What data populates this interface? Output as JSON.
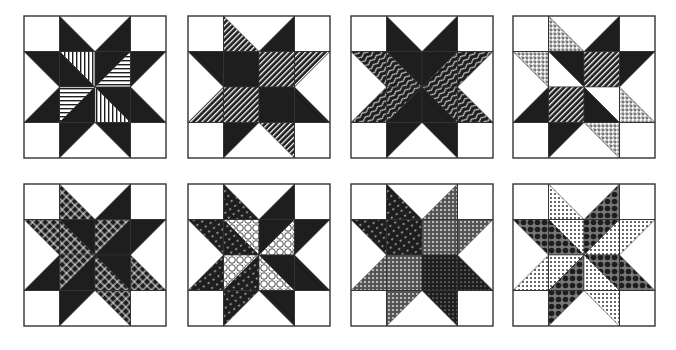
{
  "figure": {
    "grid": {
      "rows": 2,
      "cols": 4,
      "cells_per_block": 4
    },
    "colors": {
      "ink": "#1e1e1e",
      "paper": "#ffffff",
      "line": "#333333"
    },
    "blocks": [
      {
        "id": 1,
        "x": 23,
        "y": 15,
        "size": 142,
        "pieces": [
          [
            "n1L",
            "k"
          ],
          [
            "n1R",
            "k"
          ],
          [
            "e1U",
            "k"
          ],
          [
            "e1D",
            "k"
          ],
          [
            "s1L",
            "k"
          ],
          [
            "s1R",
            "k"
          ],
          [
            "w1U",
            "k"
          ],
          [
            "w1D",
            "k"
          ],
          [
            "cTLa",
            "vl"
          ],
          [
            "cTLb",
            "k"
          ],
          [
            "cTRa",
            "k"
          ],
          [
            "cTRb",
            "hl"
          ],
          [
            "cBLa",
            "hl"
          ],
          [
            "cBLb",
            "k"
          ],
          [
            "cBRa",
            "k"
          ],
          [
            "cBRb",
            "vl"
          ]
        ]
      },
      {
        "id": 2,
        "x": 187,
        "y": 15,
        "size": 142,
        "pieces": [
          [
            "n1L",
            "dg"
          ],
          [
            "n1R",
            "k"
          ],
          [
            "e1U",
            "dg"
          ],
          [
            "e1D",
            "k"
          ],
          [
            "s1L",
            "k"
          ],
          [
            "s1R",
            "dg"
          ],
          [
            "w1U",
            "k"
          ],
          [
            "w1D",
            "dg"
          ],
          [
            "cTL",
            "k"
          ],
          [
            "cTR",
            "dg"
          ],
          [
            "cBL",
            "dg"
          ],
          [
            "cBR",
            "k"
          ]
        ]
      },
      {
        "id": 3,
        "x": 350,
        "y": 15,
        "size": 142,
        "pieces": [
          [
            "n1L",
            "k"
          ],
          [
            "n1R",
            "k"
          ],
          [
            "e1U",
            "wv"
          ],
          [
            "e1D",
            "wv"
          ],
          [
            "s1L",
            "k"
          ],
          [
            "s1R",
            "k"
          ],
          [
            "w1U",
            "wv"
          ],
          [
            "w1D",
            "wv"
          ],
          [
            "xTL1",
            "k"
          ],
          [
            "xTL2",
            "wv"
          ],
          [
            "xTR1",
            "k"
          ],
          [
            "xTR2",
            "wv"
          ],
          [
            "xBL1",
            "wv"
          ],
          [
            "xBL2",
            "k"
          ],
          [
            "xBR1",
            "wv"
          ],
          [
            "xBR2",
            "k"
          ]
        ]
      },
      {
        "id": 4,
        "x": 512,
        "y": 15,
        "size": 142,
        "pieces": [
          [
            "n1L",
            "dt"
          ],
          [
            "n1R",
            "k"
          ],
          [
            "e1U",
            "k"
          ],
          [
            "e1D",
            "dt"
          ],
          [
            "s1L",
            "k"
          ],
          [
            "s1R",
            "dt"
          ],
          [
            "w1U",
            "dt"
          ],
          [
            "w1D",
            "k"
          ],
          [
            "cTLa",
            "k"
          ],
          [
            "cTLb",
            "w"
          ],
          [
            "cTR",
            "dg"
          ],
          [
            "cBL",
            "dg"
          ],
          [
            "cBRa",
            "w"
          ],
          [
            "cBRb",
            "k"
          ]
        ]
      },
      {
        "id": 5,
        "x": 23,
        "y": 183,
        "size": 142,
        "pieces": [
          [
            "n1L",
            "lt"
          ],
          [
            "n1R",
            "k"
          ],
          [
            "e1U",
            "k"
          ],
          [
            "e1D",
            "lt"
          ],
          [
            "s1L",
            "k"
          ],
          [
            "s1R",
            "lt"
          ],
          [
            "w1U",
            "lt"
          ],
          [
            "w1D",
            "k"
          ],
          [
            "cTLa",
            "k"
          ],
          [
            "cTLb",
            "lt"
          ],
          [
            "cTRa",
            "lt"
          ],
          [
            "cTRb",
            "k"
          ],
          [
            "cBLa",
            "lt"
          ],
          [
            "cBLb",
            "k"
          ],
          [
            "cBRa",
            "k"
          ],
          [
            "cBRb",
            "lt"
          ]
        ]
      },
      {
        "id": 6,
        "x": 187,
        "y": 183,
        "size": 142,
        "pieces": [
          [
            "n1L",
            "dd"
          ],
          [
            "n1R",
            "k"
          ],
          [
            "e1U",
            "k"
          ],
          [
            "e1D",
            "k"
          ],
          [
            "s1L",
            "dd"
          ],
          [
            "s1R",
            "k"
          ],
          [
            "w1U",
            "dd"
          ],
          [
            "w1D",
            "dd"
          ],
          [
            "cTLa",
            "ci"
          ],
          [
            "cTLb",
            "dd"
          ],
          [
            "cTRa",
            "k"
          ],
          [
            "cTRb",
            "ci"
          ],
          [
            "cBLa",
            "ci"
          ],
          [
            "cBLb",
            "dd"
          ],
          [
            "cBRa",
            "k"
          ],
          [
            "cBRb",
            "ci"
          ]
        ]
      },
      {
        "id": 7,
        "x": 350,
        "y": 183,
        "size": 142,
        "pieces": [
          [
            "n1L",
            "dd"
          ],
          [
            "n1R",
            "gd"
          ],
          [
            "e1U",
            "gd"
          ],
          [
            "e1D",
            "kd"
          ],
          [
            "s1L",
            "gd"
          ],
          [
            "s1R",
            "kd"
          ],
          [
            "w1U",
            "dd"
          ],
          [
            "w1D",
            "gd"
          ],
          [
            "cTL",
            "dd"
          ],
          [
            "cTR",
            "gd"
          ],
          [
            "cBL",
            "gd"
          ],
          [
            "cBR",
            "kd"
          ]
        ]
      },
      {
        "id": 8,
        "x": 512,
        "y": 183,
        "size": 142,
        "pieces": [
          [
            "n1L",
            "pd"
          ],
          [
            "n1R",
            "bc"
          ],
          [
            "e1U",
            "pd"
          ],
          [
            "e1D",
            "bc"
          ],
          [
            "s1L",
            "bc"
          ],
          [
            "s1R",
            "pd"
          ],
          [
            "w1U",
            "bc"
          ],
          [
            "w1D",
            "pd"
          ],
          [
            "cTLa",
            "pd"
          ],
          [
            "cTLb",
            "bc"
          ],
          [
            "cTRa",
            "bc"
          ],
          [
            "cTRb",
            "pd"
          ],
          [
            "cBLa",
            "pd"
          ],
          [
            "cBLb",
            "bc"
          ],
          [
            "cBRa",
            "bc"
          ],
          [
            "cBRb",
            "pd"
          ]
        ]
      }
    ],
    "fabric_legend": {
      "k": "solid-black",
      "w": "white",
      "vl": "vertical-stripes",
      "hl": "horizontal-stripes",
      "dg": "diagonal-stripes",
      "wv": "wavy-lines",
      "dt": "cross-dots",
      "lt": "lattice",
      "dd": "dark-dashes",
      "ci": "circles",
      "gd": "grey-dots",
      "kd": "dark-dots",
      "pd": "polka-dots",
      "bc": "black-circles"
    }
  }
}
